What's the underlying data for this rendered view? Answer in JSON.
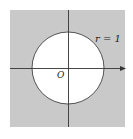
{
  "figure": {
    "labels": {
      "radius": "r = 1",
      "origin": "O"
    },
    "colors": {
      "shaded_region": "#c9c9c9",
      "interior": "#ffffff",
      "lines": "#333333"
    },
    "geometry": {
      "square": {
        "x": 10,
        "y": 10,
        "width": 115,
        "height": 117
      },
      "circle": {
        "cx": 68,
        "cy": 68,
        "r": 36
      },
      "x_axis": {
        "x1": 10,
        "y": 68,
        "x2": 125
      },
      "y_axis": {
        "x": 68,
        "y1": 10,
        "y2": 127
      }
    }
  }
}
